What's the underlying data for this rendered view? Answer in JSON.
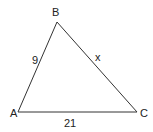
{
  "diagram": {
    "type": "triangle",
    "line_color": "#333333",
    "vertices": [
      {
        "label": "A",
        "x": 18,
        "y": 112,
        "label_x": 10,
        "label_y": 117
      },
      {
        "label": "B",
        "x": 57,
        "y": 22,
        "label_x": 52,
        "label_y": 16
      },
      {
        "label": "C",
        "x": 137,
        "y": 112,
        "label_x": 140,
        "label_y": 117
      }
    ],
    "sides": [
      {
        "name": "AB",
        "label": "9",
        "label_x": 32,
        "label_y": 64
      },
      {
        "name": "BC",
        "label": "x",
        "label_x": 95,
        "label_y": 61
      },
      {
        "name": "AC",
        "label": "21",
        "label_x": 64,
        "label_y": 127
      }
    ]
  }
}
